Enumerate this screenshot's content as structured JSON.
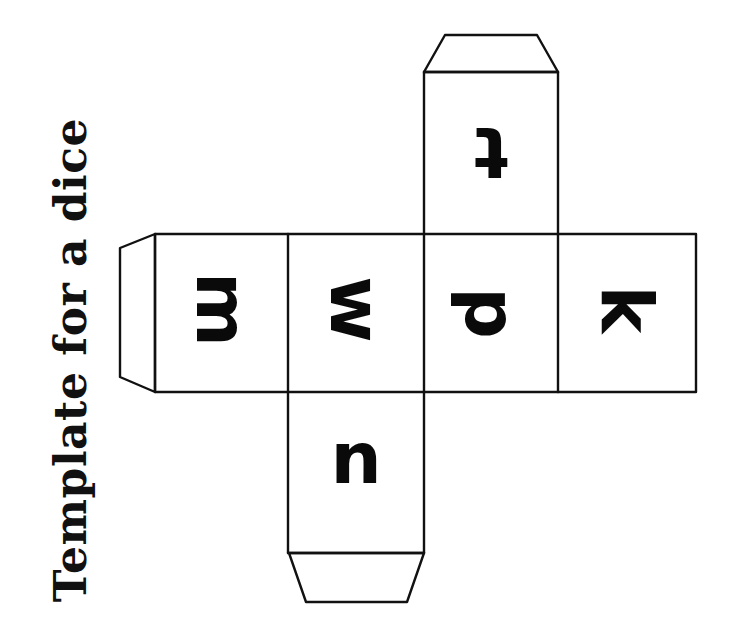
{
  "title": "Template for a dice",
  "faces": [
    {
      "id": "face-left-end",
      "letter": "m",
      "rotation": 90
    },
    {
      "id": "face-left-center",
      "letter": "w",
      "rotation": 90
    },
    {
      "id": "face-center",
      "letter": "p",
      "rotation": 180
    },
    {
      "id": "face-right-end",
      "letter": "k",
      "rotation": 270
    },
    {
      "id": "face-top",
      "letter": "t",
      "rotation": 180
    },
    {
      "id": "face-bottom",
      "letter": "u",
      "rotation": 180
    }
  ],
  "colors": {
    "ink": "#111111",
    "paper": "#ffffff"
  }
}
